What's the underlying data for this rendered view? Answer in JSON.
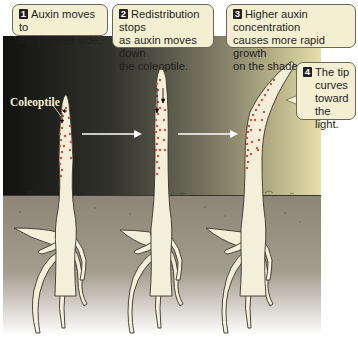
{
  "figure": {
    "label_coleoptile": "Coleoptile",
    "steps": [
      {
        "number": "1",
        "text": "Auxin moves to the shaded side.",
        "lines": [
          "Auxin moves to",
          "the shaded side."
        ]
      },
      {
        "number": "2",
        "text": "Redistribution stops as auxin moves down the coleoptile.",
        "lines": [
          "Redistribution stops",
          "as auxin moves down",
          "the coleoptile."
        ]
      },
      {
        "number": "3",
        "text": "Higher auxin concentration causes more rapid growth on the shaded side.",
        "lines": [
          "Higher auxin concentration",
          "causes more rapid growth",
          "on the shaded side."
        ]
      },
      {
        "number": "4",
        "text": "The tip curves toward the light.",
        "lines": [
          "The tip",
          "curves",
          "toward",
          "the light."
        ]
      }
    ],
    "stages": [
      {
        "name": "stage-1",
        "description": "Straight coleoptile; auxin (red dots) at tip moving laterally to shaded (left) side"
      },
      {
        "name": "stage-2",
        "description": "Straight, taller coleoptile; auxin moving downward on shaded side"
      },
      {
        "name": "stage-3",
        "description": "Coleoptile tip bent toward light (right); auxin concentrated on shaded (left) side"
      }
    ],
    "colors": {
      "dark_sky": "#1a1a17",
      "light_side": "#e9e1a8",
      "soil": "#8f8677",
      "plant": "#f4efd9",
      "auxin": "#d2503c",
      "callout_bg": "#f4efd2",
      "arrow": "#ffffff"
    }
  }
}
